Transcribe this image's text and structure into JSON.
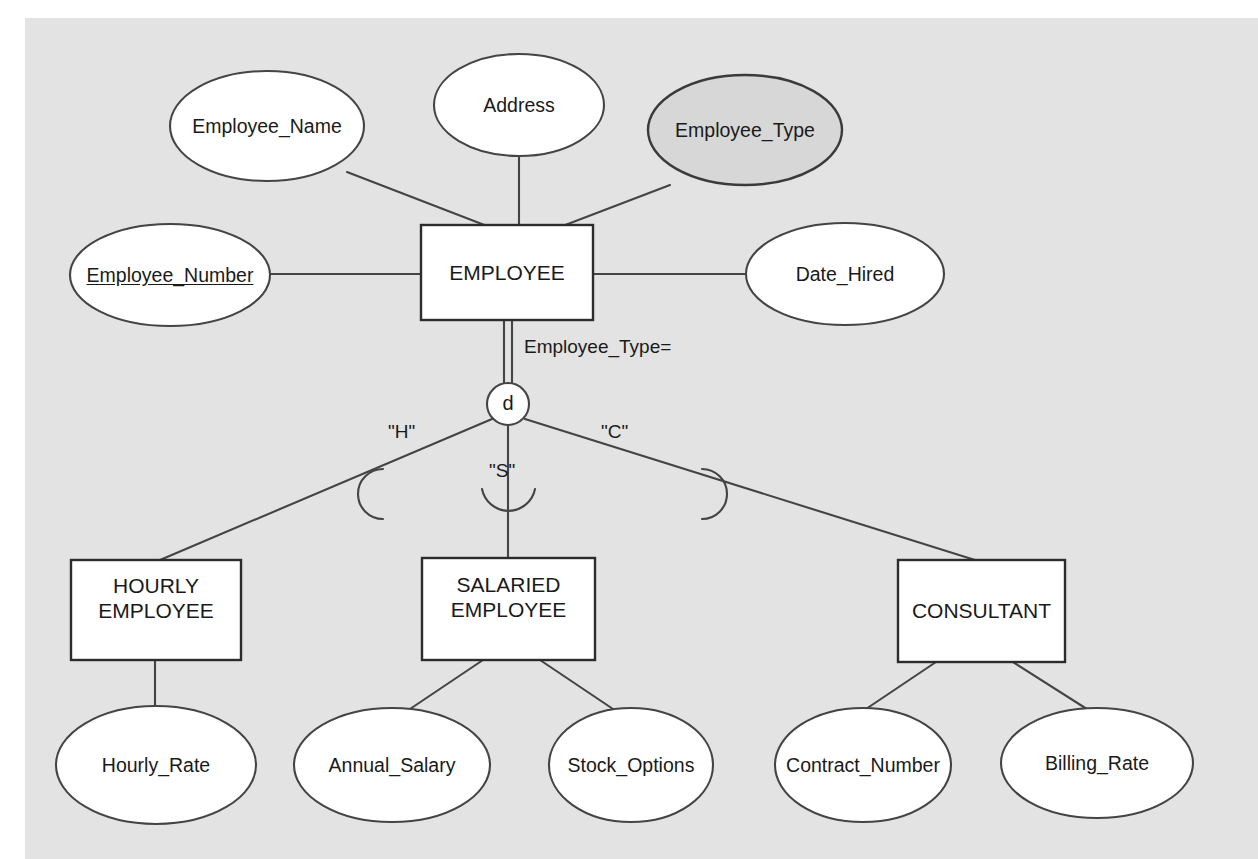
{
  "diagram": {
    "kind": "er-diagram",
    "notation": "Chen / enhanced-ER supertype-subtype",
    "background_color": "#e3e3e3",
    "page_color": "#ffffff",
    "line_color": "#444444",
    "shape_fill": "#ffffff",
    "shaded_fill": "#d7d7d7",
    "text_color": "#1a1a1a",
    "supertype": {
      "name": "EMPLOYEE",
      "shape": "rectangle",
      "attributes": [
        {
          "name": "Employee_Name",
          "shape": "ellipse",
          "fill": "white",
          "primary_key": false
        },
        {
          "name": "Address",
          "shape": "ellipse",
          "fill": "white",
          "primary_key": false
        },
        {
          "name": "Employee_Type",
          "shape": "ellipse",
          "fill": "shaded",
          "primary_key": false
        },
        {
          "name": "Employee_Number",
          "shape": "ellipse",
          "fill": "white",
          "primary_key": true
        },
        {
          "name": "Date_Hired",
          "shape": "ellipse",
          "fill": "white",
          "primary_key": false
        }
      ]
    },
    "discriminator": {
      "symbol": "d",
      "meaning": "disjoint",
      "attribute_label": "Employee_Type=",
      "connector": "double-line"
    },
    "subtypes": [
      {
        "name": "HOURLY\nEMPLOYEE",
        "discriminator_value": "\"H\"",
        "attributes": [
          {
            "name": "Hourly_Rate",
            "shape": "ellipse",
            "fill": "white"
          }
        ]
      },
      {
        "name": "SALARIED\nEMPLOYEE",
        "discriminator_value": "\"S\"",
        "attributes": [
          {
            "name": "Annual_Salary",
            "shape": "ellipse",
            "fill": "white"
          },
          {
            "name": "Stock_Options",
            "shape": "ellipse",
            "fill": "white"
          }
        ]
      },
      {
        "name": "CONSULTANT",
        "discriminator_value": "\"C\"",
        "attributes": [
          {
            "name": "Contract_Number",
            "shape": "ellipse",
            "fill": "white"
          },
          {
            "name": "Billing_Rate",
            "shape": "ellipse",
            "fill": "white"
          }
        ]
      }
    ]
  }
}
